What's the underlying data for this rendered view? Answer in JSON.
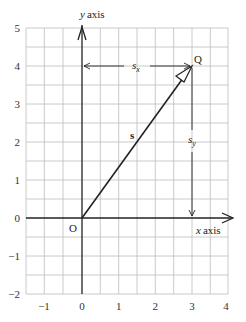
{
  "diagram": {
    "type": "vector-components-on-grid",
    "axes": {
      "x_label": "x axis",
      "y_label": "y axis",
      "x_ticks": [
        "−1",
        "0",
        "1",
        "2",
        "3",
        "4"
      ],
      "y_ticks": [
        "5",
        "4",
        "3",
        "2",
        "1",
        "0",
        "−1",
        "−2"
      ],
      "x_range": [
        -1.5,
        4
      ],
      "y_range": [
        -2,
        5
      ],
      "grid_step": 0.5
    },
    "points": {
      "origin": {
        "label": "O",
        "x": 0,
        "y": 0
      },
      "q": {
        "label": "Q",
        "x": 3,
        "y": 4
      }
    },
    "vector": {
      "label": "s",
      "from": "O",
      "to": "Q"
    },
    "components": {
      "sx": {
        "label": "s",
        "sub": "x"
      },
      "sy": {
        "label": "s",
        "sub": "y"
      }
    },
    "colors": {
      "grid": "#b8b8b8",
      "axis": "#222222",
      "vector": "#222222"
    }
  }
}
